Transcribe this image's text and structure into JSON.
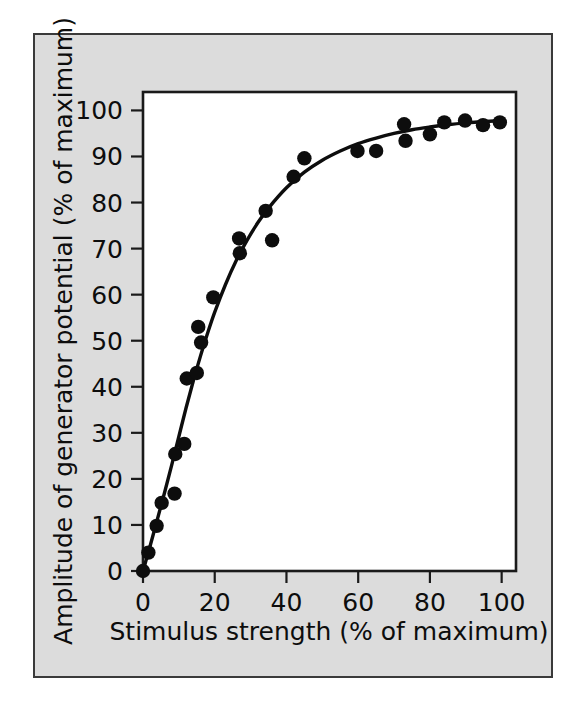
{
  "figure": {
    "panel_background": "#dcdcdc",
    "panel_border_color": "#3a3a3a",
    "plot_background": "#ffffff",
    "ink_color": "#0d0d0d"
  },
  "chart_data": {
    "type": "scatter",
    "title": "",
    "subtitle": "",
    "xlabel": "Stimulus strength (% of maximum)",
    "ylabel": "Amplitude of generator potential (% of maximum)",
    "xlim": [
      0,
      104
    ],
    "ylim": [
      0,
      104
    ],
    "xticks": [
      0,
      20,
      40,
      60,
      80,
      100
    ],
    "xtick_labels": [
      "0",
      "20",
      "40",
      "60",
      "80",
      "100"
    ],
    "yticks": [
      0,
      10,
      20,
      30,
      40,
      50,
      60,
      70,
      80,
      90,
      100
    ],
    "ytick_labels": [
      "0",
      "10",
      "20",
      "30",
      "40",
      "50",
      "60",
      "70",
      "80",
      "90",
      "100"
    ],
    "grid": false,
    "legend": null,
    "legend_position": "none",
    "annotations": [],
    "marker": "filled-circle",
    "marker_color": "#0d0d0d",
    "marker_size_px": 7.2,
    "points": [
      {
        "x": 0.0,
        "y": 0.0
      },
      {
        "x": 1.5,
        "y": 4.0
      },
      {
        "x": 3.8,
        "y": 9.8
      },
      {
        "x": 5.2,
        "y": 14.8
      },
      {
        "x": 8.8,
        "y": 16.8
      },
      {
        "x": 9.0,
        "y": 25.4
      },
      {
        "x": 11.5,
        "y": 27.6
      },
      {
        "x": 12.2,
        "y": 41.8
      },
      {
        "x": 15.0,
        "y": 43.0
      },
      {
        "x": 15.4,
        "y": 53.0
      },
      {
        "x": 16.2,
        "y": 49.6
      },
      {
        "x": 19.6,
        "y": 59.4
      },
      {
        "x": 26.8,
        "y": 72.2
      },
      {
        "x": 27.0,
        "y": 69.0
      },
      {
        "x": 34.2,
        "y": 78.2
      },
      {
        "x": 36.0,
        "y": 71.8
      },
      {
        "x": 42.0,
        "y": 85.6
      },
      {
        "x": 45.0,
        "y": 89.6
      },
      {
        "x": 59.8,
        "y": 91.2
      },
      {
        "x": 65.0,
        "y": 91.2
      },
      {
        "x": 72.8,
        "y": 97.0
      },
      {
        "x": 73.2,
        "y": 93.4
      },
      {
        "x": 80.0,
        "y": 94.8
      },
      {
        "x": 84.0,
        "y": 97.4
      },
      {
        "x": 89.8,
        "y": 97.8
      },
      {
        "x": 94.8,
        "y": 96.8
      },
      {
        "x": 99.5,
        "y": 97.4
      }
    ],
    "fit_curve": {
      "description": "saturating rise reaching plateau near 98",
      "x": [
        0,
        2,
        4,
        6,
        8,
        10,
        12,
        14,
        16,
        18,
        20,
        23,
        26,
        29,
        32,
        35,
        40,
        45,
        50,
        55,
        60,
        65,
        70,
        75,
        80,
        85,
        90,
        95,
        100
      ],
      "y": [
        0,
        5.5,
        11.2,
        17.0,
        23.0,
        29.2,
        35.4,
        41.2,
        46.6,
        51.6,
        56.2,
        62.2,
        67.4,
        71.8,
        75.6,
        78.8,
        83.2,
        86.6,
        89.2,
        91.2,
        92.8,
        94.0,
        95.0,
        95.8,
        96.4,
        96.9,
        97.3,
        97.6,
        97.8
      ]
    }
  }
}
